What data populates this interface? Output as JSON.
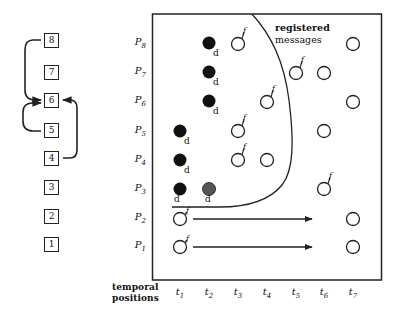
{
  "left_column": {
    "boxes": [
      {
        "label": "8",
        "y": 33
      },
      {
        "label": "7",
        "y": 65
      },
      {
        "label": "6",
        "y": 93
      },
      {
        "label": "5",
        "y": 123
      },
      {
        "label": "4",
        "y": 151
      },
      {
        "label": "3",
        "y": 180
      },
      {
        "label": "2",
        "y": 209
      },
      {
        "label": "1",
        "y": 237
      }
    ],
    "arrows": [
      {
        "from": "8",
        "to": "6",
        "side": "left"
      },
      {
        "from": "5",
        "to": "6",
        "side": "left"
      },
      {
        "from": "4",
        "to": "6",
        "side": "right"
      }
    ]
  },
  "diagram": {
    "rows": [
      {
        "name": "P",
        "sub": "8",
        "y": 43
      },
      {
        "name": "P",
        "sub": "7",
        "y": 72
      },
      {
        "name": "P",
        "sub": "6",
        "y": 101
      },
      {
        "name": "P",
        "sub": "5",
        "y": 131
      },
      {
        "name": "P",
        "sub": "4",
        "y": 160
      },
      {
        "name": "P",
        "sub": "3",
        "y": 189
      },
      {
        "name": "P",
        "sub": "2",
        "y": 218
      },
      {
        "name": "P",
        "sub": "1",
        "y": 246
      }
    ],
    "columns": [
      {
        "name": "t",
        "sub": "1",
        "x": 180
      },
      {
        "name": "t",
        "sub": "2",
        "x": 209
      },
      {
        "name": "t",
        "sub": "3",
        "x": 238
      },
      {
        "name": "t",
        "sub": "4",
        "x": 267
      },
      {
        "name": "t",
        "sub": "5",
        "x": 296
      },
      {
        "name": "t",
        "sub": "6",
        "x": 324
      },
      {
        "name": "t",
        "sub": "7",
        "x": 353
      }
    ],
    "axis_title_line1": "temporal",
    "axis_title_line2": "positions",
    "legend_line1": "registered",
    "legend_line2": "messages",
    "mark_d": "d",
    "mark_f": "f",
    "colors": {
      "filled": "#111111",
      "gray": "#555555",
      "stroke": "#222222"
    }
  },
  "points": [
    {
      "row": "P8",
      "col": "t2",
      "type": "filled",
      "mark": "d"
    },
    {
      "row": "P8",
      "col": "t3",
      "type": "open",
      "mark": "f"
    },
    {
      "row": "P8",
      "col": "t7",
      "type": "open",
      "mark": ""
    },
    {
      "row": "P7",
      "col": "t2",
      "type": "filled",
      "mark": "d"
    },
    {
      "row": "P7",
      "col": "t5",
      "type": "open",
      "mark": "f"
    },
    {
      "row": "P7",
      "col": "t6",
      "type": "open",
      "mark": ""
    },
    {
      "row": "P6",
      "col": "t2",
      "type": "filled",
      "mark": "d"
    },
    {
      "row": "P6",
      "col": "t4",
      "type": "open",
      "mark": "f"
    },
    {
      "row": "P6",
      "col": "t7",
      "type": "open",
      "mark": ""
    },
    {
      "row": "P5",
      "col": "t1",
      "type": "filled",
      "mark": "d"
    },
    {
      "row": "P5",
      "col": "t3",
      "type": "open",
      "mark": "f"
    },
    {
      "row": "P5",
      "col": "t6",
      "type": "open",
      "mark": ""
    },
    {
      "row": "P4",
      "col": "t1",
      "type": "filled",
      "mark": "d"
    },
    {
      "row": "P4",
      "col": "t3",
      "type": "open",
      "mark": "f"
    },
    {
      "row": "P4",
      "col": "t4",
      "type": "open",
      "mark": ""
    },
    {
      "row": "P3",
      "col": "t1",
      "type": "filled",
      "mark": "d"
    },
    {
      "row": "P3",
      "col": "t2",
      "type": "gray",
      "mark": "d"
    },
    {
      "row": "P3",
      "col": "t6",
      "type": "open",
      "mark": "f"
    },
    {
      "row": "P2",
      "col": "t1",
      "type": "open",
      "mark": "f"
    },
    {
      "row": "P2",
      "col": "t7",
      "type": "open",
      "mark": ""
    },
    {
      "row": "P1",
      "col": "t1",
      "type": "open",
      "mark": "f"
    },
    {
      "row": "P1",
      "col": "t7",
      "type": "open",
      "mark": ""
    }
  ],
  "arrows": [
    {
      "row": "P2",
      "from_x": 193,
      "to_x": 312
    },
    {
      "row": "P1",
      "from_x": 193,
      "to_x": 312
    }
  ]
}
